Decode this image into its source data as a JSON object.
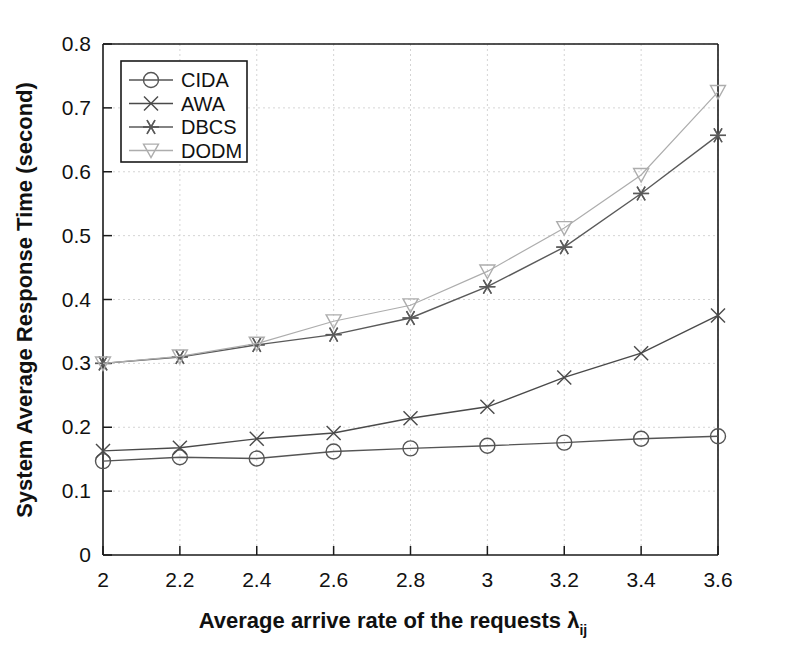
{
  "figure": {
    "background_color": "#ffffff",
    "axis_color": "#1a1a1a",
    "grid_color": "#c9c9c9"
  },
  "chart_data": {
    "type": "line",
    "title": "",
    "xlabel_main": "Average arrive rate of the requests",
    "xlabel_symbol": "λ",
    "xlabel_subscript": "ij",
    "ylabel": "System Average Response Time (second)",
    "x": [
      2,
      2.2,
      2.4,
      2.6,
      2.8,
      3,
      3.2,
      3.4,
      3.6
    ],
    "xlim": [
      2,
      3.6
    ],
    "ylim": [
      0,
      0.8
    ],
    "xticks": [
      2,
      2.2,
      2.4,
      2.6,
      2.8,
      3,
      3.2,
      3.4,
      3.6
    ],
    "xtick_labels": [
      "2",
      "2.2",
      "2.4",
      "2.6",
      "2.8",
      "3",
      "3.2",
      "3.4",
      "3.6"
    ],
    "yticks": [
      0,
      0.1,
      0.2,
      0.3,
      0.4,
      0.5,
      0.6,
      0.7,
      0.8
    ],
    "ytick_labels": [
      "0",
      "0.1",
      "0.2",
      "0.3",
      "0.4",
      "0.5",
      "0.6",
      "0.7",
      "0.8"
    ],
    "grid": true,
    "legend_position": "upper-left",
    "series": [
      {
        "name": "CIDA",
        "marker": "circle",
        "color": "#555555",
        "values": [
          0.147,
          0.153,
          0.151,
          0.162,
          0.167,
          0.171,
          0.176,
          0.182,
          0.186
        ]
      },
      {
        "name": "AWA",
        "marker": "x",
        "color": "#4a4a4a",
        "values": [
          0.163,
          0.168,
          0.182,
          0.191,
          0.214,
          0.232,
          0.278,
          0.316,
          0.375
        ]
      },
      {
        "name": "DBCS",
        "marker": "asterisk",
        "color": "#5a5a5a",
        "values": [
          0.3,
          0.31,
          0.329,
          0.345,
          0.371,
          0.42,
          0.482,
          0.566,
          0.657
        ]
      },
      {
        "name": "DODM",
        "marker": "triangle-down",
        "color": "#adadad",
        "values": [
          0.3,
          0.311,
          0.331,
          0.366,
          0.391,
          0.444,
          0.512,
          0.595,
          0.725
        ]
      }
    ]
  },
  "legend": {
    "items": [
      {
        "label": "CIDA"
      },
      {
        "label": "AWA"
      },
      {
        "label": "DBCS"
      },
      {
        "label": "DODM"
      }
    ]
  }
}
